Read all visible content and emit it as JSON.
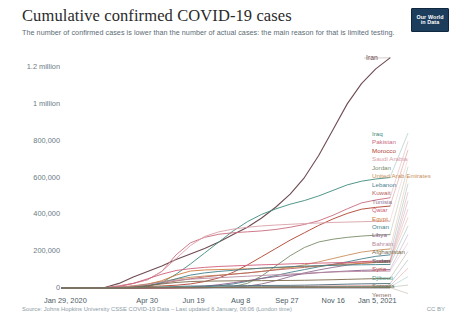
{
  "header": {
    "title": "Cumulative confirmed COVID-19 cases",
    "subtitle": "The number of confirmed cases is lower than the number of actual cases: the main reason for that is limited testing.",
    "logo_line1": "Our World",
    "logo_line2": "in Data"
  },
  "footer": {
    "source": "Source: Johns Hopkins University CSSE COVID-19 Data – Last updated 6 January, 06:06 (London time)",
    "license": "CC BY"
  },
  "highlight_label": "Iran",
  "chart_data": {
    "type": "line",
    "title": "Cumulative confirmed COVID-19 cases",
    "subtitle": "The number of confirmed cases is lower than the number of actual cases: the main reason for that is limited testing.",
    "xlabel": "",
    "ylabel": "",
    "grid": false,
    "legend_position": "right",
    "x_tick_labels": [
      "Jan 29, 2020",
      "Apr 30",
      "Jun 19",
      "Aug 8",
      "Sep 27",
      "Nov 16",
      "Jan 5, 2021"
    ],
    "x_tick_fracs": [
      0.0,
      0.262,
      0.403,
      0.545,
      0.686,
      0.827,
      0.968
    ],
    "y_tick_labels": [
      "0",
      "200,000",
      "400,000",
      "600,000",
      "800,000",
      "1 million",
      "1.2 million"
    ],
    "y_tick_values": [
      0,
      200000,
      400000,
      600000,
      800000,
      1000000,
      1200000
    ],
    "ylim": [
      0,
      1260000
    ],
    "xlim_dates": [
      "Jan 29, 2020",
      "Jan 5, 2021"
    ],
    "series": [
      {
        "name": "Iran",
        "color": "#6e4b52",
        "final_value": 1250000,
        "values": [
          0,
          0,
          500,
          3000,
          25000,
          60000,
          90000,
          120000,
          155000,
          185000,
          215000,
          250000,
          290000,
          330000,
          380000,
          440000,
          510000,
          600000,
          720000,
          860000,
          1000000,
          1110000,
          1190000,
          1250000
        ]
      },
      {
        "name": "Iraq",
        "color": "#3d8b7d",
        "final_value": 600000,
        "values": [
          0,
          0,
          100,
          500,
          1500,
          3500,
          9000,
          30000,
          75000,
          130000,
          190000,
          250000,
          310000,
          360000,
          400000,
          430000,
          455000,
          475000,
          500000,
          530000,
          560000,
          580000,
          592000,
          600000
        ]
      },
      {
        "name": "Pakistan",
        "color": "#c86b7e",
        "final_value": 490000,
        "values": [
          0,
          0,
          200,
          2000,
          12000,
          25000,
          45000,
          90000,
          180000,
          245000,
          275000,
          292000,
          300000,
          305000,
          310000,
          318000,
          330000,
          345000,
          365000,
          395000,
          430000,
          462000,
          478000,
          490000
        ]
      },
      {
        "name": "Morocco",
        "color": "#b0412e",
        "final_value": 445000,
        "values": [
          0,
          0,
          100,
          800,
          3500,
          6000,
          8000,
          11000,
          15000,
          22000,
          35000,
          55000,
          85000,
          125000,
          170000,
          215000,
          260000,
          300000,
          340000,
          375000,
          405000,
          428000,
          438000,
          445000
        ]
      },
      {
        "name": "Saudi Arabia",
        "color": "#d9a0a8",
        "final_value": 363000,
        "values": [
          0,
          0,
          50,
          1000,
          10000,
          25000,
          45000,
          90000,
          160000,
          230000,
          280000,
          305000,
          320000,
          330000,
          337000,
          342000,
          346000,
          350000,
          353000,
          356000,
          358000,
          360000,
          362000,
          363000
        ]
      },
      {
        "name": "Jordan",
        "color": "#7a8c6a",
        "final_value": 290000,
        "values": [
          0,
          0,
          20,
          300,
          400,
          450,
          600,
          800,
          1100,
          1500,
          2000,
          3000,
          8000,
          25000,
          65000,
          120000,
          175000,
          220000,
          250000,
          265000,
          275000,
          282000,
          287000,
          290000
        ]
      },
      {
        "name": "United Arab Emirates",
        "color": "#c98f5e",
        "final_value": 212000,
        "values": [
          0,
          0,
          50,
          800,
          5000,
          12000,
          22000,
          35000,
          48000,
          58000,
          65000,
          70000,
          76000,
          82000,
          90000,
          100000,
          112000,
          126000,
          142000,
          160000,
          178000,
          195000,
          205000,
          212000
        ]
      },
      {
        "name": "Lebanon",
        "color": "#4a7f8f",
        "final_value": 180000,
        "values": [
          0,
          0,
          30,
          300,
          600,
          800,
          1000,
          1400,
          2000,
          3500,
          6500,
          12000,
          22000,
          36000,
          52000,
          68000,
          85000,
          100000,
          115000,
          128000,
          142000,
          158000,
          172000,
          180000
        ]
      },
      {
        "name": "Kuwait",
        "color": "#b5645f",
        "final_value": 150000,
        "values": [
          0,
          0,
          30,
          500,
          2500,
          7000,
          14000,
          25000,
          38000,
          50000,
          60000,
          68000,
          75000,
          82000,
          90000,
          98000,
          105000,
          112000,
          120000,
          128000,
          136000,
          143000,
          147000,
          150000
        ]
      },
      {
        "name": "Tunisia",
        "color": "#8e6e8e",
        "final_value": 145000,
        "values": [
          0,
          0,
          20,
          200,
          600,
          900,
          1100,
          1200,
          1300,
          1500,
          2000,
          3000,
          5000,
          10000,
          22000,
          40000,
          62000,
          82000,
          98000,
          112000,
          124000,
          134000,
          141000,
          145000
        ]
      },
      {
        "name": "Qatar",
        "color": "#d05f7a",
        "final_value": 143000,
        "values": [
          0,
          0,
          50,
          900,
          8000,
          25000,
          50000,
          75000,
          95000,
          105000,
          112000,
          117000,
          120000,
          123000,
          126000,
          128000,
          131000,
          133000,
          135000,
          137000,
          139000,
          141000,
          142000,
          143000
        ]
      },
      {
        "name": "Egypt",
        "color": "#cf7a3c",
        "final_value": 140000,
        "values": [
          0,
          0,
          100,
          800,
          3500,
          10000,
          20000,
          40000,
          70000,
          92000,
          98000,
          100000,
          102000,
          104000,
          107000,
          110000,
          113000,
          116000,
          120000,
          124000,
          129000,
          134000,
          138000,
          140000
        ]
      },
      {
        "name": "Oman",
        "color": "#3f7f8a",
        "final_value": 128000,
        "values": [
          0,
          0,
          20,
          300,
          1500,
          4000,
          12000,
          28000,
          50000,
          70000,
          82000,
          90000,
          96000,
          102000,
          108000,
          112000,
          116000,
          119000,
          121000,
          123000,
          125000,
          126000,
          127000,
          128000
        ]
      },
      {
        "name": "Libya",
        "color": "#8a5f8a",
        "final_value": 100000,
        "values": [
          0,
          0,
          0,
          50,
          100,
          200,
          400,
          800,
          2000,
          5000,
          10000,
          18000,
          28000,
          40000,
          52000,
          62000,
          70000,
          77000,
          83000,
          88000,
          92000,
          96000,
          98000,
          100000
        ]
      },
      {
        "name": "Bahrain",
        "color": "#b88aa0",
        "final_value": 92000,
        "values": [
          0,
          0,
          50,
          800,
          4000,
          10000,
          20000,
          33000,
          42000,
          48000,
          52000,
          56000,
          60000,
          64000,
          68000,
          72000,
          76000,
          80000,
          84000,
          87000,
          89000,
          90000,
          91000,
          92000
        ]
      },
      {
        "name": "Afghanistan",
        "color": "#7a6a4a",
        "final_value": 52000,
        "values": [
          0,
          0,
          20,
          300,
          1500,
          5000,
          12000,
          22000,
          30000,
          35000,
          37000,
          38000,
          39000,
          39500,
          40000,
          40500,
          41000,
          42000,
          43500,
          45000,
          47000,
          49000,
          51000,
          52000
        ]
      },
      {
        "name": "Sudan",
        "color": "#4a6a7a",
        "final_value": 24000,
        "values": [
          0,
          0,
          0,
          50,
          200,
          800,
          2000,
          4500,
          8000,
          10500,
          11500,
          12000,
          12500,
          13000,
          13500,
          14000,
          14500,
          15500,
          17000,
          19000,
          21000,
          22500,
          23500,
          24000
        ]
      },
      {
        "name": "Syria",
        "color": "#c0504a",
        "final_value": 11000,
        "values": [
          0,
          0,
          0,
          20,
          50,
          100,
          200,
          400,
          700,
          1200,
          2000,
          3000,
          4000,
          5000,
          6000,
          7000,
          8000,
          8800,
          9400,
          9900,
          10300,
          10600,
          10800,
          11000
        ]
      },
      {
        "name": "Djibouti",
        "color": "#4a9a8a",
        "final_value": 5900,
        "values": [
          0,
          0,
          0,
          100,
          800,
          2500,
          4200,
          4800,
          5100,
          5300,
          5400,
          5450,
          5500,
          5550,
          5600,
          5650,
          5700,
          5750,
          5800,
          5830,
          5860,
          5880,
          5890,
          5900
        ]
      },
      {
        "name": "Somalia",
        "color": "#6a7a5a",
        "final_value": 4800,
        "values": [
          0,
          0,
          0,
          50,
          400,
          1500,
          2600,
          3100,
          3300,
          3400,
          3500,
          3600,
          3700,
          3800,
          3900,
          4000,
          4150,
          4300,
          4450,
          4550,
          4650,
          4720,
          4770,
          4800
        ]
      },
      {
        "name": "Yemen",
        "color": "#8a6a5a",
        "final_value": 2100,
        "values": [
          0,
          0,
          0,
          10,
          50,
          300,
          1000,
          1500,
          1800,
          1950,
          2000,
          2020,
          2030,
          2040,
          2050,
          2055,
          2060,
          2065,
          2070,
          2080,
          2090,
          2095,
          2098,
          2100
        ]
      }
    ]
  },
  "legend": {
    "items": [
      {
        "label": "Iraq",
        "color": "#3d8b7d"
      },
      {
        "label": "Pakistan",
        "color": "#c86b7e"
      },
      {
        "label": "Morocco",
        "color": "#b0412e"
      },
      {
        "label": "Saudi Arabia",
        "color": "#d9a0a8"
      },
      {
        "label": "Jordan",
        "color": "#7a8c6a"
      },
      {
        "label": "United Arab Emirates",
        "color": "#c98f5e"
      },
      {
        "label": "Lebanon",
        "color": "#4a7f8f"
      },
      {
        "label": "Kuwait",
        "color": "#b5645f"
      },
      {
        "label": "Tunisia",
        "color": "#8e6e8e"
      },
      {
        "label": "Qatar",
        "color": "#d05f7a"
      },
      {
        "label": "Egypt",
        "color": "#cf7a3c"
      },
      {
        "label": "Oman",
        "color": "#3f7f8a"
      },
      {
        "label": "Libya",
        "color": "#8a5f8a"
      },
      {
        "label": "Bahrain",
        "color": "#b88aa0"
      },
      {
        "label": "Afghanistan",
        "color": "#7a6a4a"
      },
      {
        "label": "Sudan",
        "color": "#4a6a7a"
      },
      {
        "label": "Syria",
        "color": "#c0504a"
      },
      {
        "label": "Djibouti",
        "color": "#4a9a8a"
      },
      {
        "label": "Somalia",
        "color": "#6a7a5a"
      },
      {
        "label": "Yemen",
        "color": "#8a6a5a"
      }
    ]
  }
}
